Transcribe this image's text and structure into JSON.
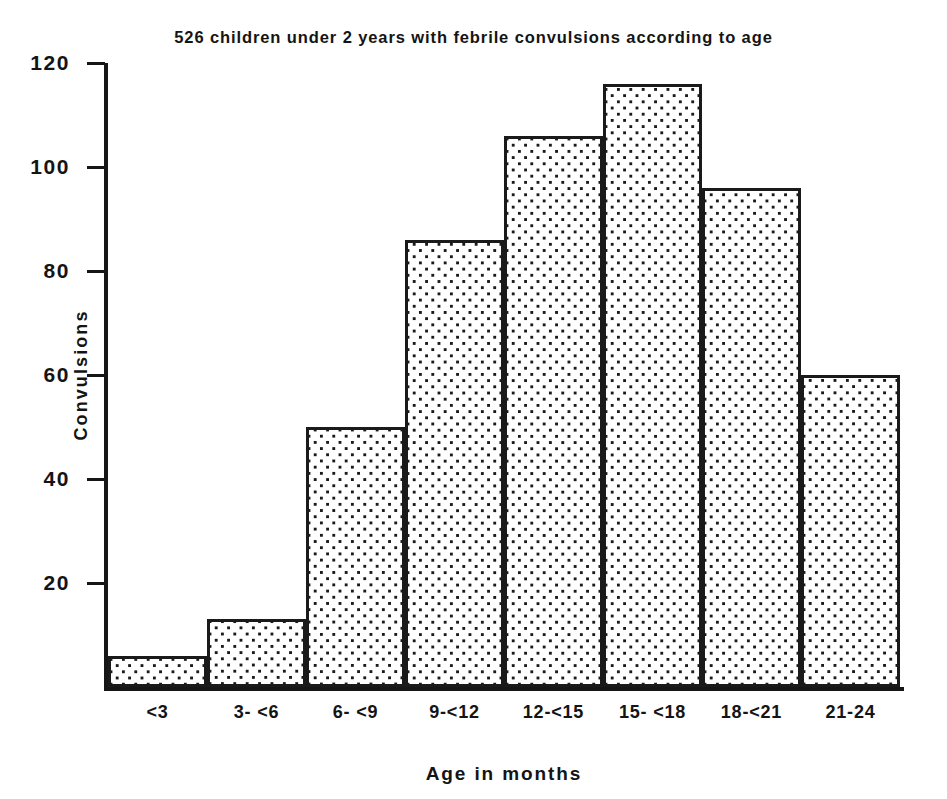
{
  "chart_data": {
    "type": "bar",
    "title": "526 children under 2 years with febrile convulsions according to age",
    "xlabel": "Age in months",
    "ylabel": "Convulsions",
    "categories": [
      "<3",
      "3- <6",
      "6- <9",
      "9-<12",
      "12-<15",
      "15- <18",
      "18-<21",
      "21-24"
    ],
    "values": [
      6,
      13,
      50,
      86,
      106,
      116,
      96,
      60
    ],
    "ylim": [
      0,
      120
    ],
    "yticks": [
      20,
      40,
      60,
      80,
      100,
      120
    ],
    "ytick_labels": [
      "20",
      "40",
      "60",
      "80",
      "100",
      "120"
    ],
    "grid": false,
    "legend": null,
    "bar_fill": "dotted-stipple",
    "bar_edge_color": "#1a1a1a",
    "background_color": "#ffffff",
    "total_subjects": 526
  }
}
